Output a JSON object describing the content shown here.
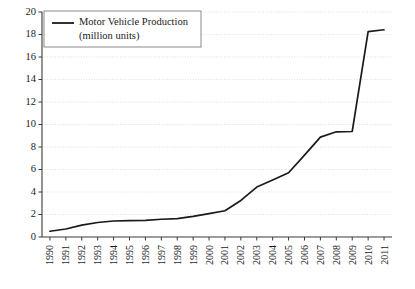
{
  "chart_data": {
    "type": "line",
    "title": "",
    "xlabel": "",
    "ylabel": "",
    "ylim": [
      0,
      20
    ],
    "ytick_step": 2,
    "grid": true,
    "grid_style": "dotted",
    "legend_position": "top-left",
    "line_color": "#1a1a1a",
    "grid_color": "#d8d8e0",
    "axis_color": "#3a3a3a",
    "legend_border_color": "#8a8a8a",
    "legend": [
      {
        "name": "Motor Vehicle Production",
        "name_line2": "(million units)"
      }
    ],
    "categories": [
      "1990",
      "1991",
      "1992",
      "1993",
      "1994",
      "1995",
      "1996",
      "1997",
      "1998",
      "1999",
      "2000",
      "2001",
      "2002",
      "2003",
      "2004",
      "2005",
      "2006",
      "2007",
      "2008",
      "2009",
      "2010",
      "2011"
    ],
    "ytick_labels": [
      "0",
      "2",
      "4",
      "6",
      "8",
      "10",
      "12",
      "14",
      "16",
      "18",
      "20"
    ],
    "series": [
      {
        "name": "Motor Vehicle Production (million units)",
        "values": [
          0.51,
          0.71,
          1.06,
          1.29,
          1.42,
          1.45,
          1.47,
          1.58,
          1.63,
          1.83,
          2.07,
          2.33,
          3.25,
          4.44,
          5.07,
          5.71,
          7.28,
          8.88,
          9.35,
          9.38,
          18.26,
          18.42
        ]
      }
    ]
  }
}
